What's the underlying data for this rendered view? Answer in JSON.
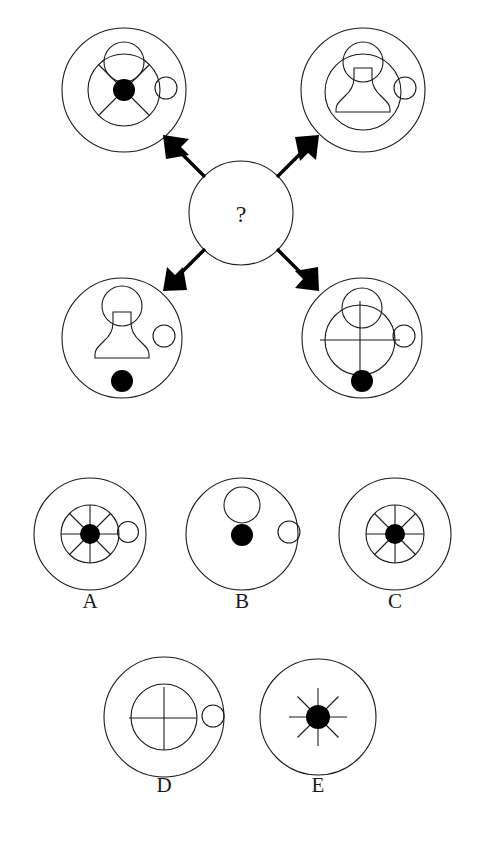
{
  "puzzle": {
    "type": "visual-analogy-matrix",
    "center": {
      "label": "?",
      "cx": 241,
      "cy": 213,
      "r": 52
    },
    "matrix_items": [
      {
        "name": "top-left",
        "cx": 124,
        "cy": 90,
        "outer_r": 62,
        "features": [
          "outer-circle",
          "medium-circle",
          "x-cross-4-spokes",
          "black-center-dot",
          "small-circle-top-overlap",
          "small-circle-right-edge"
        ]
      },
      {
        "name": "top-right",
        "cx": 363,
        "cy": 90,
        "outer_r": 62,
        "features": [
          "outer-circle",
          "medium-circle",
          "pawn-anvil-shape",
          "small-circle-top-overlap",
          "small-circle-right-edge"
        ]
      },
      {
        "name": "bottom-left",
        "cx": 122,
        "cy": 338,
        "outer_r": 60,
        "features": [
          "outer-circle",
          "pawn-anvil-shape",
          "black-dot-bottom",
          "small-circle-right-edge"
        ]
      },
      {
        "name": "bottom-right",
        "cx": 362,
        "cy": 338,
        "outer_r": 60,
        "features": [
          "outer-circle",
          "medium-circle",
          "plus-cross",
          "small-circle-top-overlap",
          "black-dot-bottom",
          "small-circle-right-edge"
        ]
      }
    ],
    "arrows": [
      {
        "name": "arrow-to-top-left",
        "direction": "up-left"
      },
      {
        "name": "arrow-to-top-right",
        "direction": "up-right"
      },
      {
        "name": "arrow-to-bottom-left",
        "direction": "down-left"
      },
      {
        "name": "arrow-to-bottom-right",
        "direction": "down-right"
      }
    ],
    "options": [
      {
        "id": "A",
        "label": "A",
        "cx": 90,
        "cy": 534,
        "outer_r": 56,
        "features": [
          "outer-circle",
          "medium-circle",
          "eight-spokes",
          "black-center-dot",
          "small-circle-right-edge"
        ]
      },
      {
        "id": "B",
        "label": "B",
        "cx": 242,
        "cy": 534,
        "outer_r": 56,
        "features": [
          "outer-circle",
          "small-circle-upper",
          "black-dot-center",
          "small-circle-right-edge"
        ]
      },
      {
        "id": "C",
        "label": "C",
        "cx": 395,
        "cy": 534,
        "outer_r": 56,
        "features": [
          "outer-circle",
          "medium-circle",
          "eight-spokes",
          "black-center-dot"
        ]
      },
      {
        "id": "D",
        "label": "D",
        "cx": 164,
        "cy": 717,
        "outer_r": 60,
        "features": [
          "outer-circle",
          "medium-circle",
          "plus-cross",
          "small-circle-right-edge"
        ]
      },
      {
        "id": "E",
        "label": "E",
        "cx": 318,
        "cy": 717,
        "outer_r": 58,
        "features": [
          "outer-circle",
          "eight-spokes",
          "black-center-dot"
        ]
      }
    ]
  },
  "colors": {
    "ink": "#1a1a1a",
    "fill_black": "#000000",
    "background": "#ffffff"
  }
}
